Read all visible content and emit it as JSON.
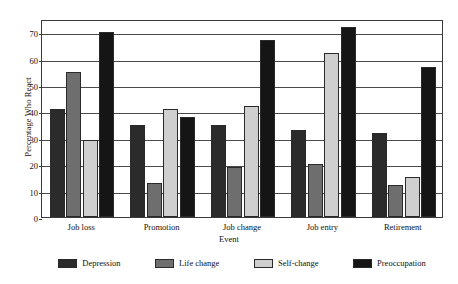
{
  "chart_data": {
    "type": "bar",
    "title": "",
    "xlabel": "Event",
    "ylabel": "Percentage Who React",
    "categories": [
      "Job loss",
      "Promotion",
      "Job change",
      "Job entry",
      "Retirement"
    ],
    "series": [
      {
        "name": "Depression",
        "color": "#2b2b2b",
        "values": [
          41,
          35,
          35,
          33,
          32
        ]
      },
      {
        "name": "Life change",
        "color": "#6e6e6e",
        "values": [
          55,
          13,
          19,
          20,
          12
        ]
      },
      {
        "name": "Self-change",
        "color": "#cfcfcf",
        "values": [
          29,
          41,
          42,
          62,
          15
        ]
      },
      {
        "name": "Preoccupation",
        "color": "#151515",
        "values": [
          70,
          38,
          67,
          72,
          57
        ]
      }
    ],
    "ylim": [
      0,
      75
    ],
    "yticks": [
      0,
      10,
      20,
      30,
      40,
      50,
      60,
      70
    ],
    "ytick_labels": [
      "0",
      "10",
      "20",
      "30",
      "40",
      "50",
      "60",
      "70"
    ],
    "grid": true,
    "grid_axis": "y",
    "legend_position": "bottom",
    "bar_edge_color": "#2a2a2a",
    "frame_color": "#3a3a3a",
    "background": "#ffffff"
  }
}
